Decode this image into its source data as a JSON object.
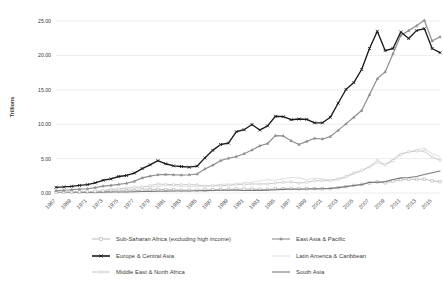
{
  "chart_data": {
    "type": "line",
    "title": "",
    "xlabel": "",
    "ylabel": "Trillions",
    "ylim": [
      0,
      25
    ],
    "ytick_labels": [
      "0.00",
      "5.00",
      "10.00",
      "15.00",
      "20.00",
      "25.00"
    ],
    "ytick_values": [
      0,
      5,
      10,
      15,
      20,
      25
    ],
    "grid": true,
    "legend_position": "bottom",
    "x": [
      1967,
      1968,
      1969,
      1970,
      1971,
      1972,
      1973,
      1974,
      1975,
      1976,
      1977,
      1978,
      1979,
      1980,
      1981,
      1982,
      1983,
      1984,
      1985,
      1986,
      1987,
      1988,
      1989,
      1990,
      1991,
      1992,
      1993,
      1994,
      1995,
      1996,
      1997,
      1998,
      1999,
      2000,
      2001,
      2002,
      2003,
      2004,
      2005,
      2006,
      2007,
      2008,
      2009,
      2010,
      2011,
      2012,
      2013,
      2014,
      2015,
      2016
    ],
    "xtick_labels": [
      "1967",
      "1969",
      "1971",
      "1973",
      "1975",
      "1977",
      "1979",
      "1981",
      "1983",
      "1985",
      "1987",
      "1989",
      "1991",
      "1993",
      "1995",
      "1997",
      "1999",
      "2001",
      "2003",
      "2005",
      "2007",
      "2009",
      "2011",
      "2013",
      "2015"
    ],
    "series": [
      {
        "name": "Sub-Saharan Africa (excluding high income)",
        "color": "#bfbfbf",
        "marker": "square",
        "width": 1.0,
        "values": [
          0.1,
          0.11,
          0.12,
          0.14,
          0.15,
          0.17,
          0.22,
          0.27,
          0.3,
          0.31,
          0.35,
          0.4,
          0.47,
          0.52,
          0.5,
          0.46,
          0.43,
          0.42,
          0.41,
          0.45,
          0.5,
          0.52,
          0.53,
          0.58,
          0.58,
          0.57,
          0.53,
          0.52,
          0.6,
          0.63,
          0.65,
          0.61,
          0.61,
          0.63,
          0.62,
          0.63,
          0.78,
          0.93,
          1.1,
          1.25,
          1.45,
          1.62,
          1.48,
          1.73,
          1.92,
          1.98,
          2.0,
          2.02,
          1.75,
          1.65
        ]
      },
      {
        "name": "Europe & Central Asia",
        "color": "#1a1a1a",
        "marker": "x",
        "width": 1.35,
        "values": [
          0.82,
          0.88,
          0.97,
          1.1,
          1.22,
          1.48,
          1.85,
          2.05,
          2.4,
          2.55,
          2.9,
          3.55,
          4.1,
          4.7,
          4.25,
          3.95,
          3.85,
          3.75,
          3.9,
          5.1,
          6.2,
          7.05,
          7.25,
          8.9,
          9.2,
          9.95,
          9.15,
          9.75,
          11.15,
          11.1,
          10.65,
          10.75,
          10.7,
          10.2,
          10.2,
          11.0,
          13.05,
          15.05,
          16.05,
          17.95,
          21.0,
          23.5,
          20.7,
          21.0,
          23.4,
          22.45,
          23.6,
          23.9,
          21.0,
          20.4
        ]
      },
      {
        "name": "Middle East & North Africa",
        "color": "#c9c9c9",
        "marker": "circle",
        "width": 1.0,
        "values": [
          0.12,
          0.13,
          0.15,
          0.17,
          0.2,
          0.24,
          0.32,
          0.55,
          0.6,
          0.72,
          0.82,
          0.88,
          1.05,
          1.3,
          1.25,
          1.2,
          1.22,
          1.22,
          1.18,
          1.0,
          1.05,
          1.05,
          1.12,
          1.25,
          1.25,
          1.32,
          1.3,
          1.32,
          1.45,
          1.55,
          1.6,
          1.45,
          1.55,
          1.8,
          1.78,
          1.82,
          2.05,
          2.4,
          2.9,
          3.3,
          3.8,
          4.7,
          4.1,
          4.7,
          5.6,
          6.0,
          6.1,
          6.1,
          5.2,
          4.8
        ]
      },
      {
        "name": "East Asia & Pacific",
        "color": "#8f8f8f",
        "marker": "triangle",
        "width": 1.2,
        "values": [
          0.35,
          0.4,
          0.47,
          0.55,
          0.62,
          0.78,
          1.0,
          1.12,
          1.25,
          1.42,
          1.7,
          2.2,
          2.45,
          2.65,
          2.7,
          2.65,
          2.6,
          2.65,
          2.75,
          3.5,
          4.05,
          4.7,
          5.05,
          5.3,
          5.7,
          6.25,
          6.85,
          7.2,
          8.35,
          8.3,
          7.6,
          7.05,
          7.5,
          7.95,
          7.85,
          8.2,
          9.1,
          10.05,
          11.0,
          12.0,
          14.3,
          16.6,
          17.6,
          20.25,
          22.9,
          23.6,
          24.3,
          25.1,
          22.1,
          22.7
        ]
      },
      {
        "name": "Latin America & Caribbean",
        "color": "#e3e3e3",
        "marker": "none",
        "width": 1.1,
        "values": [
          0.12,
          0.13,
          0.15,
          0.17,
          0.2,
          0.24,
          0.3,
          0.38,
          0.43,
          0.48,
          0.55,
          0.62,
          0.76,
          0.95,
          1.1,
          1.1,
          0.95,
          0.92,
          0.95,
          1.1,
          1.1,
          1.25,
          1.3,
          1.35,
          1.5,
          1.6,
          1.75,
          1.95,
          1.85,
          2.05,
          2.25,
          2.2,
          1.95,
          2.15,
          2.05,
          1.85,
          1.95,
          2.25,
          2.75,
          3.2,
          3.8,
          4.35,
          4.1,
          5.0,
          5.75,
          5.9,
          6.3,
          6.5,
          5.7,
          5.3
        ]
      },
      {
        "name": "South Asia",
        "color": "#7a7a7a",
        "marker": "none",
        "width": 1.1,
        "values": [
          0.07,
          0.08,
          0.08,
          0.09,
          0.09,
          0.1,
          0.12,
          0.14,
          0.15,
          0.15,
          0.18,
          0.21,
          0.23,
          0.26,
          0.27,
          0.28,
          0.3,
          0.3,
          0.32,
          0.34,
          0.37,
          0.41,
          0.41,
          0.42,
          0.36,
          0.38,
          0.38,
          0.42,
          0.47,
          0.52,
          0.55,
          0.54,
          0.58,
          0.6,
          0.62,
          0.67,
          0.78,
          0.92,
          1.08,
          1.22,
          1.55,
          1.55,
          1.65,
          1.95,
          2.2,
          2.25,
          2.4,
          2.7,
          2.95,
          3.2
        ]
      }
    ]
  },
  "legend": {
    "entries": [
      {
        "label": "Sub-Saharan Africa (excluding high income)"
      },
      {
        "label": "East Asia & Pacific"
      },
      {
        "label": "Europe & Central Asia"
      },
      {
        "label": "Latin America & Caribbean"
      },
      {
        "label": "Middle East & North Africa"
      },
      {
        "label": "South Asia"
      }
    ]
  }
}
